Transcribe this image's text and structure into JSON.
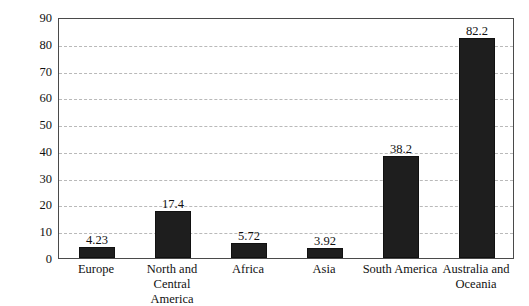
{
  "chart_data": {
    "type": "bar",
    "title": "",
    "xlabel": "",
    "ylabel": "1000 cubic meters per person per year",
    "categories": [
      "Europe",
      "North and Central America",
      "Africa",
      "Asia",
      "South America",
      "Australia and Oceania"
    ],
    "category_lines": [
      [
        "Europe"
      ],
      [
        "North and Central",
        "America"
      ],
      [
        "Africa"
      ],
      [
        "Asia"
      ],
      [
        "South America"
      ],
      [
        "Australia and",
        "Oceania"
      ]
    ],
    "values": [
      4.23,
      17.4,
      5.72,
      3.92,
      38.2,
      82.2
    ],
    "value_labels": [
      "4.23",
      "17.4",
      "5.72",
      "3.92",
      "38.2",
      "82.2"
    ],
    "ylim": [
      0,
      90
    ],
    "yticks": [
      0,
      10,
      20,
      30,
      40,
      50,
      60,
      70,
      80,
      90
    ],
    "ytick_labels": [
      "0",
      "10",
      "20",
      "30",
      "40",
      "50",
      "60",
      "70",
      "80",
      "90"
    ],
    "grid": true,
    "grid_style": "dashed",
    "legend": "none",
    "bar_color": "#1e1e1e",
    "grid_color": "#b9b9b9",
    "axis_color": "#4a4a4a",
    "text_color": "#111111"
  }
}
